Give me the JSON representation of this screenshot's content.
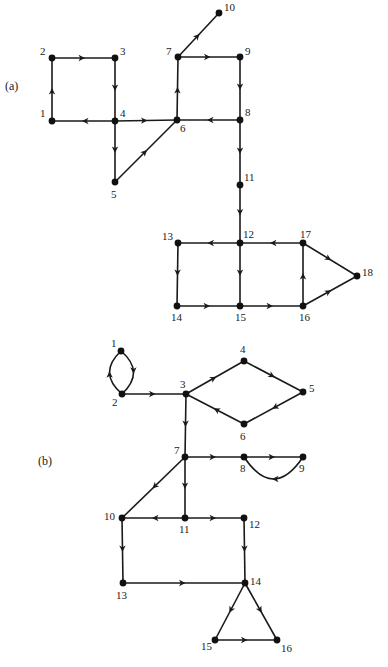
{
  "figure": {
    "background": "#ffffff",
    "ink": "#1a1a1a",
    "graphs": [
      {
        "id": "a",
        "label": "(a)",
        "label_pos": [
          5,
          90
        ],
        "nodes": [
          {
            "id": "1",
            "x": 52,
            "y": 121,
            "lx": -12,
            "ly": -4
          },
          {
            "id": "2",
            "x": 52,
            "y": 58,
            "lx": -12,
            "ly": -3
          },
          {
            "id": "3",
            "x": 115,
            "y": 58,
            "lx": 5,
            "ly": -3
          },
          {
            "id": "4",
            "x": 115,
            "y": 121,
            "lx": 5,
            "ly": -4
          },
          {
            "id": "5",
            "x": 115,
            "y": 182,
            "lx": -4,
            "ly": 16
          },
          {
            "id": "6",
            "x": 177,
            "y": 120,
            "lx": 3,
            "ly": 12
          },
          {
            "id": "7",
            "x": 178,
            "y": 57,
            "lx": -12,
            "ly": -2
          },
          {
            "id": "8",
            "x": 240,
            "y": 120,
            "lx": 5,
            "ly": -4
          },
          {
            "id": "9",
            "x": 240,
            "y": 57,
            "lx": 5,
            "ly": -2
          },
          {
            "id": "10",
            "x": 219,
            "y": 13,
            "lx": 5,
            "ly": -2
          },
          {
            "id": "11",
            "x": 240,
            "y": 185,
            "lx": 4,
            "ly": -4
          },
          {
            "id": "12",
            "x": 240,
            "y": 243,
            "lx": 3,
            "ly": -5
          },
          {
            "id": "13",
            "x": 178,
            "y": 243,
            "lx": -16,
            "ly": -3
          },
          {
            "id": "14",
            "x": 177,
            "y": 306,
            "lx": -6,
            "ly": 15
          },
          {
            "id": "15",
            "x": 240,
            "y": 306,
            "lx": -5,
            "ly": 15
          },
          {
            "id": "16",
            "x": 303,
            "y": 306,
            "lx": -4,
            "ly": 15
          },
          {
            "id": "17",
            "x": 303,
            "y": 243,
            "lx": -3,
            "ly": -5
          },
          {
            "id": "18",
            "x": 357,
            "y": 276,
            "lx": 5,
            "ly": 0
          }
        ],
        "edges": [
          {
            "from": "1",
            "to": "2"
          },
          {
            "from": "2",
            "to": "3"
          },
          {
            "from": "3",
            "to": "4"
          },
          {
            "from": "4",
            "to": "1"
          },
          {
            "from": "4",
            "to": "6"
          },
          {
            "from": "4",
            "to": "5"
          },
          {
            "from": "5",
            "to": "6"
          },
          {
            "from": "6",
            "to": "7"
          },
          {
            "from": "7",
            "to": "10"
          },
          {
            "from": "7",
            "to": "9"
          },
          {
            "from": "9",
            "to": "8"
          },
          {
            "from": "8",
            "to": "6"
          },
          {
            "from": "8",
            "to": "11"
          },
          {
            "from": "11",
            "to": "12"
          },
          {
            "from": "12",
            "to": "13"
          },
          {
            "from": "12",
            "to": "15"
          },
          {
            "from": "13",
            "to": "14"
          },
          {
            "from": "14",
            "to": "15"
          },
          {
            "from": "15",
            "to": "16"
          },
          {
            "from": "16",
            "to": "17"
          },
          {
            "from": "17",
            "to": "12"
          },
          {
            "from": "17",
            "to": "18"
          },
          {
            "from": "16",
            "to": "18"
          }
        ]
      },
      {
        "id": "b",
        "label": "(b)",
        "label_pos": [
          38,
          465
        ],
        "nodes": [
          {
            "id": "1",
            "x": 121,
            "y": 351,
            "lx": -10,
            "ly": -4
          },
          {
            "id": "2",
            "x": 122,
            "y": 394,
            "lx": -10,
            "ly": 12
          },
          {
            "id": "3",
            "x": 186,
            "y": 394,
            "lx": -6,
            "ly": -6
          },
          {
            "id": "4",
            "x": 244,
            "y": 361,
            "lx": -4,
            "ly": -8
          },
          {
            "id": "5",
            "x": 303,
            "y": 392,
            "lx": 6,
            "ly": 0
          },
          {
            "id": "6",
            "x": 244,
            "y": 424,
            "lx": -4,
            "ly": 16
          },
          {
            "id": "7",
            "x": 185,
            "y": 457,
            "lx": -11,
            "ly": -3
          },
          {
            "id": "8",
            "x": 244,
            "y": 457,
            "lx": -4,
            "ly": 15
          },
          {
            "id": "9",
            "x": 303,
            "y": 457,
            "lx": -4,
            "ly": 15
          },
          {
            "id": "10",
            "x": 122,
            "y": 518,
            "lx": -18,
            "ly": 2
          },
          {
            "id": "11",
            "x": 185,
            "y": 518,
            "lx": -6,
            "ly": 15
          },
          {
            "id": "12",
            "x": 244,
            "y": 518,
            "lx": 5,
            "ly": 10
          },
          {
            "id": "13",
            "x": 123,
            "y": 583,
            "lx": -7,
            "ly": 16
          },
          {
            "id": "14",
            "x": 245,
            "y": 583,
            "lx": 5,
            "ly": 2
          },
          {
            "id": "15",
            "x": 215,
            "y": 640,
            "lx": -14,
            "ly": 10
          },
          {
            "id": "16",
            "x": 277,
            "y": 640,
            "lx": 4,
            "ly": 12
          }
        ],
        "edges": [
          {
            "from": "1",
            "to": "2",
            "curve": 12
          },
          {
            "from": "2",
            "to": "1",
            "curve": 12
          },
          {
            "from": "2",
            "to": "3"
          },
          {
            "from": "3",
            "to": "4"
          },
          {
            "from": "4",
            "to": "5"
          },
          {
            "from": "5",
            "to": "6"
          },
          {
            "from": "6",
            "to": "3"
          },
          {
            "from": "3",
            "to": "7"
          },
          {
            "from": "7",
            "to": "8"
          },
          {
            "from": "8",
            "to": "9"
          },
          {
            "from": "9",
            "to": "8",
            "curve": 22
          },
          {
            "from": "7",
            "to": "10"
          },
          {
            "from": "7",
            "to": "11"
          },
          {
            "from": "11",
            "to": "10"
          },
          {
            "from": "11",
            "to": "12"
          },
          {
            "from": "10",
            "to": "13"
          },
          {
            "from": "12",
            "to": "14"
          },
          {
            "from": "13",
            "to": "14"
          },
          {
            "from": "14",
            "to": "15"
          },
          {
            "from": "14",
            "to": "16"
          },
          {
            "from": "15",
            "to": "16"
          }
        ]
      }
    ]
  }
}
